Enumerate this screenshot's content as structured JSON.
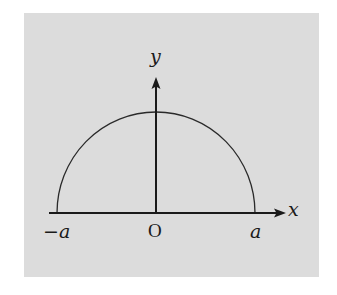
{
  "figure": {
    "background_color": "#dcdcdc",
    "line_color": "#1a1a1a",
    "labels": {
      "y_axis": "y",
      "x_axis": "x",
      "origin": "O",
      "left_endpoint": "−a",
      "right_endpoint": "a"
    },
    "shapes": {
      "curve": "semicircle of radius a centered at origin (upper half)",
      "axes": "x-axis and y-axis with arrowheads"
    }
  }
}
